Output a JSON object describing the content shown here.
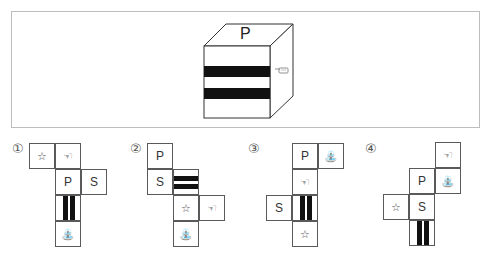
{
  "cube": {
    "top_face": "P",
    "front_face": "two-horizontal-stripes",
    "right_face_icon": "pointing-hand"
  },
  "symbols": {
    "P": "P",
    "S": "S",
    "star": "☆",
    "hand": "☜",
    "fountain": "⛲"
  },
  "options": [
    {
      "label": "①",
      "cells": [
        {
          "face": "star",
          "text": "☆"
        },
        {
          "face": "hand",
          "text": "☜"
        },
        {
          "face": "P",
          "text": "P"
        },
        {
          "face": "S",
          "text": "S"
        },
        {
          "face": "stripes-vertical",
          "text": ""
        },
        {
          "face": "fountain",
          "text": "⛲"
        }
      ]
    },
    {
      "label": "②",
      "cells": [
        {
          "face": "P",
          "text": "P"
        },
        {
          "face": "S",
          "text": "S"
        },
        {
          "face": "stripes-horizontal",
          "text": ""
        },
        {
          "face": "star",
          "text": "☆"
        },
        {
          "face": "hand",
          "text": "☜"
        },
        {
          "face": "fountain",
          "text": "⛲"
        }
      ]
    },
    {
      "label": "③",
      "cells": [
        {
          "face": "P",
          "text": "P"
        },
        {
          "face": "fountain",
          "text": "⛲"
        },
        {
          "face": "hand",
          "text": "☜"
        },
        {
          "face": "S",
          "text": "S"
        },
        {
          "face": "stripes-vertical",
          "text": ""
        },
        {
          "face": "star",
          "text": "☆"
        }
      ]
    },
    {
      "label": "④",
      "cells": [
        {
          "face": "hand",
          "text": "☜"
        },
        {
          "face": "P",
          "text": "P"
        },
        {
          "face": "fountain",
          "text": "⛲"
        },
        {
          "face": "star",
          "text": "☆"
        },
        {
          "face": "S",
          "text": "S"
        },
        {
          "face": "stripes-vertical",
          "text": ""
        }
      ]
    }
  ]
}
